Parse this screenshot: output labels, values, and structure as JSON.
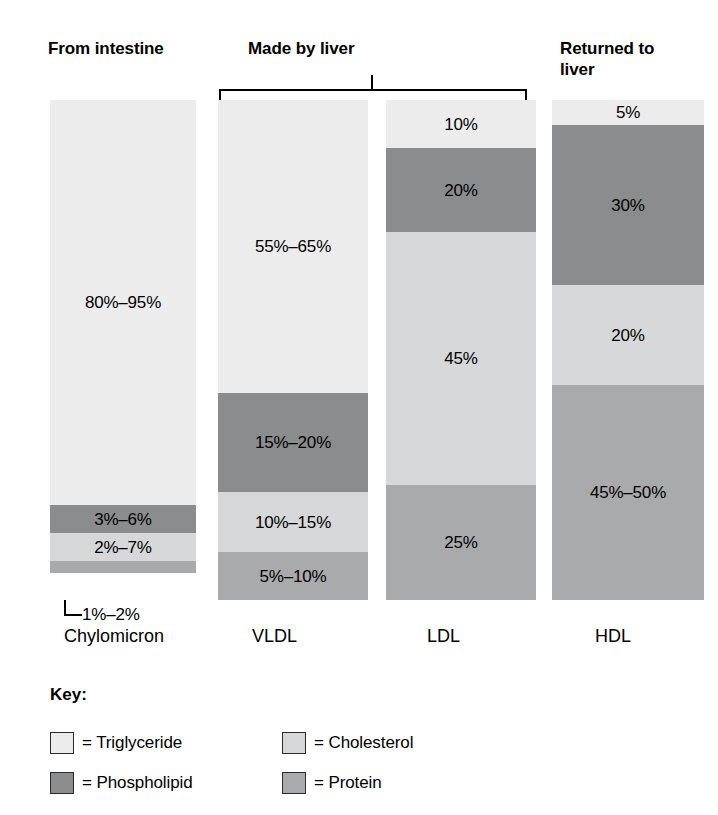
{
  "headers": {
    "intestine": "From intestine",
    "liver": "Made by liver",
    "returned": "Returned to\nliver"
  },
  "key": {
    "title": "Key:",
    "items": [
      {
        "label": "= Triglyceride",
        "component": "Triglyceride",
        "color": "#ececed"
      },
      {
        "label": "= Cholesterol",
        "component": "Cholesterol",
        "color": "#d6d7d8"
      },
      {
        "label": "= Phospholipid",
        "component": "Phospholipid",
        "color": "#8b8c8d"
      },
      {
        "label": "= Protein",
        "component": "Protein",
        "color": "#a9aaab"
      }
    ]
  },
  "colors": {
    "triglyceride": "#ececed",
    "cholesterol": "#d6d7d8",
    "phospholipid": "#8b8c8d",
    "protein": "#a9aaab",
    "rule": "#000000",
    "background": "#ffffff"
  },
  "chart_data": {
    "type": "bar",
    "title": "",
    "xlabel": "",
    "ylabel": "",
    "ylim": [
      0,
      100
    ],
    "stacked": true,
    "orientation": "vertical",
    "grid": false,
    "legend_position": "bottom-left",
    "categories": [
      "Chylomicron",
      "VLDL",
      "LDL",
      "HDL"
    ],
    "group_headers": [
      {
        "label": "From intestine",
        "spans": [
          "Chylomicron"
        ],
        "bracket": false
      },
      {
        "label": "Made by liver",
        "spans": [
          "VLDL",
          "LDL"
        ],
        "bracket": true
      },
      {
        "label": "Returned to liver",
        "spans": [
          "HDL"
        ],
        "bracket": false
      }
    ],
    "series": [
      {
        "name": "Triglyceride",
        "values": [
          87.5,
          60,
          10,
          5
        ]
      },
      {
        "name": "Phospholipid",
        "values": [
          4.5,
          17.5,
          20,
          30
        ]
      },
      {
        "name": "Cholesterol",
        "values": [
          4.5,
          12.5,
          45,
          20
        ]
      },
      {
        "name": "Protein",
        "values": [
          1.5,
          7.5,
          25,
          47.5
        ]
      }
    ],
    "bars": [
      {
        "category": "Chylomicron",
        "segments": [
          {
            "component": "Triglyceride",
            "label": "80%–95%",
            "pct_low": 80,
            "pct_high": 95,
            "height_pct": 81.0,
            "label_inside": true
          },
          {
            "component": "Phospholipid",
            "label": "3%–6%",
            "pct_low": 3,
            "pct_high": 6,
            "height_pct": 5.6,
            "label_inside": true
          },
          {
            "component": "Cholesterol",
            "label": "2%–7%",
            "pct_low": 2,
            "pct_high": 7,
            "height_pct": 5.6,
            "label_inside": true
          },
          {
            "component": "Protein",
            "label": "1%–2%",
            "pct_low": 1,
            "pct_high": 2,
            "height_pct": 2.4,
            "label_inside": false
          }
        ]
      },
      {
        "category": "VLDL",
        "segments": [
          {
            "component": "Triglyceride",
            "label": "55%–65%",
            "pct_low": 55,
            "pct_high": 65,
            "height_pct": 58.6,
            "label_inside": true
          },
          {
            "component": "Phospholipid",
            "label": "15%–20%",
            "pct_low": 15,
            "pct_high": 20,
            "height_pct": 19.8,
            "label_inside": true
          },
          {
            "component": "Cholesterol",
            "label": "10%–15%",
            "pct_low": 10,
            "pct_high": 15,
            "height_pct": 12.0,
            "label_inside": true
          },
          {
            "component": "Protein",
            "label": "5%–10%",
            "pct_low": 5,
            "pct_high": 10,
            "height_pct": 9.6,
            "label_inside": true
          }
        ]
      },
      {
        "category": "LDL",
        "segments": [
          {
            "component": "Triglyceride",
            "label": "10%",
            "pct_low": 10,
            "pct_high": 10,
            "height_pct": 9.6,
            "label_inside": true
          },
          {
            "component": "Phospholipid",
            "label": "20%",
            "pct_low": 20,
            "pct_high": 20,
            "height_pct": 16.8,
            "label_inside": true
          },
          {
            "component": "Cholesterol",
            "label": "45%",
            "pct_low": 45,
            "pct_high": 45,
            "height_pct": 50.6,
            "label_inside": true
          },
          {
            "component": "Protein",
            "label": "25%",
            "pct_low": 25,
            "pct_high": 25,
            "height_pct": 23.0,
            "label_inside": true
          }
        ]
      },
      {
        "category": "HDL",
        "segments": [
          {
            "component": "Triglyceride",
            "label": "5%",
            "pct_low": 5,
            "pct_high": 5,
            "height_pct": 5.0,
            "label_inside": true
          },
          {
            "component": "Phospholipid",
            "label": "30%",
            "pct_low": 30,
            "pct_high": 30,
            "height_pct": 32.0,
            "label_inside": true
          },
          {
            "component": "Cholesterol",
            "label": "20%",
            "pct_low": 20,
            "pct_high": 20,
            "height_pct": 20.0,
            "label_inside": true
          },
          {
            "component": "Protein",
            "label": "45%–50%",
            "pct_low": 45,
            "pct_high": 50,
            "height_pct": 43.0,
            "label_inside": true
          }
        ]
      }
    ]
  }
}
